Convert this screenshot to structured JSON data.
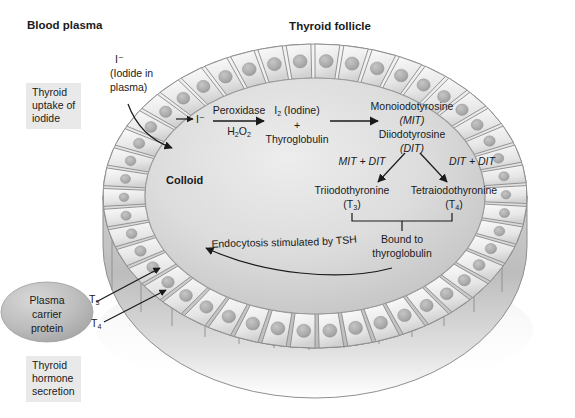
{
  "figure": {
    "title_top_left": "Blood plasma",
    "title_top_center": "Thyroid follicle",
    "colloid_label": "Colloid"
  },
  "boxes": {
    "uptake": "Thyroid\nuptake of\niodide",
    "secretion": "Thyroid\nhormone\nsecretion"
  },
  "callouts": {
    "iodide_plasma_l1": "I⁻",
    "iodide_plasma_l2": "(Iodide in",
    "iodide_plasma_l3": "plasma)",
    "iodide_membrane": "I⁻",
    "endocytosis": "Endocytosis stimulated by TSH"
  },
  "pathway": {
    "enzyme_above": "Peroxidase",
    "enzyme_below": "H2O2",
    "enzyme_below_parts": {
      "h": "H",
      "two_a": "2",
      "o": "O",
      "two_b": "2"
    },
    "iodine_line1": "I2 (Iodine)",
    "iodine_plus": "+",
    "iodine_line3": "Thyroglobulin",
    "mit_name": "Monoiodotyrosine",
    "mit_abbrev": "(MIT)",
    "dit_name": "Diiodotyrosine",
    "dit_abbrev": "(DIT)",
    "combo_left": "MIT + DIT",
    "combo_right": "DIT + DIT",
    "t3_name": "Triiodothyronine",
    "t3_abbrev": "(T3)",
    "t4_name": "Tetraiodothyronine",
    "t4_abbrev": "(T4)",
    "bound_line1": "Bound to",
    "bound_line2": "thyroglobulin"
  },
  "secretion": {
    "carrier_l1": "Plasma",
    "carrier_l2": "carrier",
    "carrier_l3": "protein",
    "t3_tag": "T3",
    "t4_tag": "T4"
  },
  "colors": {
    "ink": "#1a1a1a",
    "box_bg": "#e9e9e9",
    "colloid_light": "#e3e3e3",
    "colloid_mid": "#c9c9c9",
    "cell_fill": "#efefef",
    "cell_stroke": "#7a7a7a",
    "nucleus": "#b4b4b4",
    "wall_mid": "#c0c0c0",
    "carrier_protein": "#bdbdbd",
    "arrow": "#1a1a1a"
  }
}
